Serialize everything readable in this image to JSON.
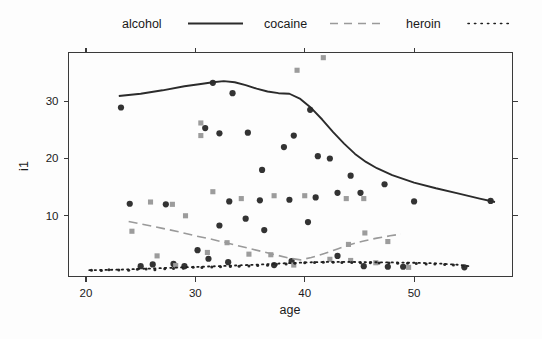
{
  "chart_data": {
    "type": "scatter",
    "title": "",
    "xlabel": "age",
    "ylabel": "i1",
    "xlim": [
      18.4,
      59.0
    ],
    "ylim": [
      -0.6,
      38.5
    ],
    "xticks": [
      20,
      30,
      40,
      50
    ],
    "yticks": [
      10,
      20,
      30
    ],
    "grid": false,
    "legend": {
      "position": "top",
      "entries": [
        {
          "label": "alcohol",
          "style": "solid",
          "color": "#2b2b2b",
          "marker": "circle",
          "marker_color": "#333333"
        },
        {
          "label": "cocaine",
          "style": "dashed",
          "color": "#9a9a9a",
          "marker": "square",
          "marker_color": "#9c9c9c"
        },
        {
          "label": "heroin",
          "style": "dotted",
          "color": "#1f1f1f",
          "marker": "dot",
          "marker_color": "#2a2a2a"
        }
      ]
    },
    "series": [
      {
        "name": "alcohol",
        "marker": "circle",
        "points": [
          [
            23.2,
            28.9
          ],
          [
            31.6,
            33.2
          ],
          [
            33.4,
            31.4
          ],
          [
            30.9,
            25.3
          ],
          [
            32.2,
            24.4
          ],
          [
            34.8,
            24.5
          ],
          [
            40.5,
            28.5
          ],
          [
            39.0,
            24.0
          ],
          [
            42.3,
            20.0
          ],
          [
            41.2,
            20.4
          ],
          [
            38.1,
            22.0
          ],
          [
            36.1,
            18.0
          ],
          [
            44.2,
            17.0
          ],
          [
            43.0,
            14.0
          ],
          [
            45.1,
            14.0
          ],
          [
            47.3,
            15.5
          ],
          [
            50.0,
            12.5
          ],
          [
            57.0,
            12.6
          ],
          [
            24.0,
            12.1
          ],
          [
            27.3,
            12.0
          ],
          [
            33.1,
            12.5
          ],
          [
            35.9,
            12.7
          ],
          [
            38.6,
            12.8
          ],
          [
            41.0,
            13.2
          ],
          [
            32.2,
            8.3
          ],
          [
            34.6,
            9.5
          ],
          [
            36.3,
            7.5
          ],
          [
            40.3,
            8.9
          ],
          [
            30.2,
            4.0
          ],
          [
            31.2,
            2.5
          ],
          [
            33.0,
            1.9
          ],
          [
            38.8,
            2.1
          ],
          [
            26.1,
            1.5
          ],
          [
            28.0,
            1.6
          ],
          [
            43.0,
            3.0
          ],
          [
            45.4,
            1.2
          ],
          [
            47.6,
            1.1
          ],
          [
            49.0,
            1.1
          ],
          [
            54.6,
            1.0
          ],
          [
            37.2,
            1.4
          ],
          [
            29.0,
            1.2
          ],
          [
            25.0,
            1.2
          ]
        ]
      },
      {
        "name": "cocaine",
        "marker": "square",
        "points": [
          [
            39.3,
            35.4
          ],
          [
            41.7,
            37.6
          ],
          [
            30.5,
            26.2
          ],
          [
            30.5,
            24.0
          ],
          [
            25.9,
            12.4
          ],
          [
            27.9,
            12.0
          ],
          [
            31.6,
            14.2
          ],
          [
            34.2,
            13.0
          ],
          [
            37.2,
            13.5
          ],
          [
            40.0,
            13.5
          ],
          [
            43.8,
            13.0
          ],
          [
            45.4,
            13.0
          ],
          [
            24.2,
            7.3
          ],
          [
            29.1,
            10.0
          ],
          [
            32.9,
            5.3
          ],
          [
            44.0,
            5.0
          ],
          [
            45.5,
            7.0
          ],
          [
            47.6,
            5.5
          ],
          [
            26.5,
            3.0
          ],
          [
            31.1,
            3.6
          ],
          [
            34.9,
            3.3
          ],
          [
            36.9,
            3.2
          ],
          [
            42.3,
            2.4
          ],
          [
            44.2,
            2.2
          ],
          [
            46.5,
            1.8
          ],
          [
            28.2,
            1.3
          ],
          [
            49.5,
            1.0
          ],
          [
            39.0,
            1.4
          ]
        ]
      },
      {
        "name": "heroin",
        "marker": "dot",
        "points": [
          [
            20.5,
            0.5
          ],
          [
            21.4,
            0.45
          ],
          [
            22.1,
            0.6
          ],
          [
            23.0,
            0.55
          ],
          [
            23.9,
            0.5
          ],
          [
            24.7,
            0.65
          ],
          [
            25.5,
            0.7
          ],
          [
            26.3,
            0.6
          ],
          [
            27.2,
            0.75
          ],
          [
            28.0,
            0.8
          ],
          [
            28.9,
            0.85
          ],
          [
            29.8,
            1.0
          ],
          [
            30.6,
            0.95
          ],
          [
            31.5,
            1.05
          ],
          [
            32.3,
            1.1
          ],
          [
            33.2,
            1.15
          ],
          [
            34.0,
            1.2
          ],
          [
            34.9,
            1.25
          ],
          [
            35.7,
            1.3
          ],
          [
            36.6,
            1.35
          ],
          [
            37.4,
            1.5
          ],
          [
            38.3,
            1.6
          ],
          [
            39.1,
            1.7
          ],
          [
            40.0,
            1.8
          ],
          [
            40.9,
            1.85
          ],
          [
            41.7,
            1.9
          ],
          [
            42.6,
            1.9
          ],
          [
            43.4,
            1.85
          ],
          [
            44.3,
            1.85
          ],
          [
            45.1,
            1.8
          ],
          [
            46.0,
            1.8
          ],
          [
            46.8,
            1.75
          ],
          [
            47.7,
            1.75
          ],
          [
            48.5,
            1.7
          ],
          [
            49.4,
            1.7
          ],
          [
            50.2,
            1.65
          ],
          [
            51.1,
            1.6
          ],
          [
            51.9,
            1.6
          ],
          [
            52.8,
            1.5
          ],
          [
            53.6,
            1.4
          ],
          [
            54.5,
            1.2
          ]
        ]
      }
    ],
    "fitted_lines": [
      {
        "name": "alcohol",
        "style": "solid",
        "color": "#2b2b2b",
        "points": [
          [
            23.0,
            30.9
          ],
          [
            25.0,
            31.3
          ],
          [
            27.0,
            31.9
          ],
          [
            29.0,
            32.6
          ],
          [
            30.5,
            33.0
          ],
          [
            31.6,
            33.3
          ],
          [
            32.6,
            33.5
          ],
          [
            33.6,
            33.3
          ],
          [
            34.6,
            32.8
          ],
          [
            35.6,
            32.2
          ],
          [
            36.6,
            31.7
          ],
          [
            37.6,
            31.4
          ],
          [
            38.6,
            31.3
          ],
          [
            39.6,
            30.4
          ],
          [
            40.6,
            28.8
          ],
          [
            41.6,
            26.8
          ],
          [
            42.6,
            24.6
          ],
          [
            43.6,
            22.6
          ],
          [
            44.6,
            20.8
          ],
          [
            45.6,
            19.4
          ],
          [
            46.6,
            18.3
          ],
          [
            48.0,
            17.1
          ],
          [
            50.0,
            15.8
          ],
          [
            52.0,
            14.8
          ],
          [
            54.0,
            13.9
          ],
          [
            56.0,
            13.0
          ],
          [
            57.4,
            12.4
          ]
        ]
      },
      {
        "name": "cocaine",
        "style": "dashed",
        "color": "#9a9a9a",
        "points": [
          [
            23.9,
            9.0
          ],
          [
            25.5,
            8.4
          ],
          [
            27.0,
            7.8
          ],
          [
            28.5,
            7.2
          ],
          [
            30.0,
            6.5
          ],
          [
            31.5,
            5.9
          ],
          [
            33.0,
            5.2
          ],
          [
            34.5,
            4.5
          ],
          [
            36.0,
            3.8
          ],
          [
            37.5,
            3.1
          ],
          [
            38.6,
            2.6
          ],
          [
            39.6,
            2.3
          ],
          [
            40.6,
            2.7
          ],
          [
            41.8,
            3.4
          ],
          [
            43.0,
            4.2
          ],
          [
            44.2,
            5.0
          ],
          [
            45.4,
            5.6
          ],
          [
            46.6,
            6.1
          ],
          [
            47.8,
            6.5
          ],
          [
            48.8,
            6.8
          ]
        ]
      },
      {
        "name": "heroin",
        "style": "dotted",
        "color": "#1f1f1f",
        "points": [
          [
            20.3,
            0.5
          ],
          [
            23.0,
            0.6
          ],
          [
            26.0,
            0.8
          ],
          [
            29.0,
            1.0
          ],
          [
            32.0,
            1.2
          ],
          [
            34.0,
            1.35
          ],
          [
            36.0,
            1.5
          ],
          [
            38.0,
            1.7
          ],
          [
            40.0,
            1.85
          ],
          [
            42.0,
            1.95
          ],
          [
            44.0,
            1.95
          ],
          [
            46.0,
            1.9
          ],
          [
            48.0,
            1.85
          ],
          [
            50.0,
            1.8
          ],
          [
            52.0,
            1.7
          ],
          [
            54.0,
            1.45
          ],
          [
            55.0,
            1.2
          ]
        ]
      }
    ]
  },
  "axes": {
    "xlabel": "age",
    "ylabel": "i1",
    "x_tick_labels": [
      "20",
      "30",
      "40",
      "50"
    ],
    "y_tick_labels": [
      "10",
      "20",
      "30"
    ]
  },
  "legend": {
    "alcohol_label": "alcohol",
    "cocaine_label": "cocaine",
    "heroin_label": "heroin"
  },
  "colors": {
    "alcohol": "#2b2b2b",
    "cocaine": "#9a9a9a",
    "heroin": "#1f1f1f",
    "axis": "#3a3a3a",
    "background": "#fdfdfd"
  }
}
